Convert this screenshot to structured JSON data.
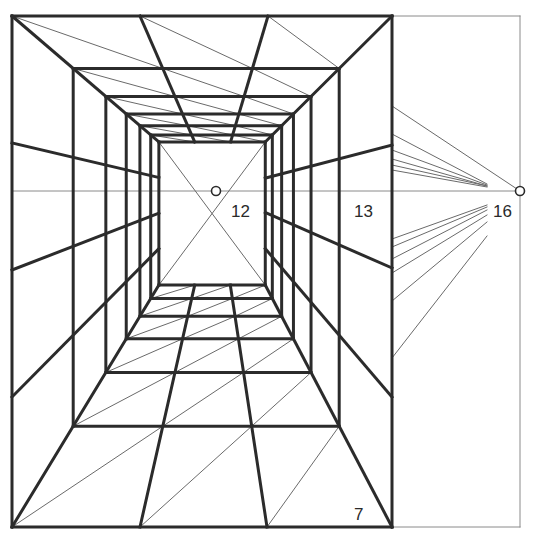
{
  "colors": {
    "background": "#ffffff",
    "heavy_line": "#2b2b2b",
    "thin_line": "#6a6a6a",
    "guide_line": "#8a8a8a"
  },
  "vanishing_point": {
    "x": 216,
    "y": 191,
    "label": "12"
  },
  "horizon_line": {
    "y": 191,
    "x1": 12,
    "x2": 520
  },
  "distance_point": {
    "x": 520,
    "y": 191,
    "label": "16"
  },
  "outer_frame": {
    "left": 12,
    "top": 16,
    "right": 392,
    "bottom": 527
  },
  "reference_frame": {
    "right": 520,
    "top": 16,
    "bottom": 527
  },
  "depth_scales": [
    1,
    0.7,
    0.54,
    0.44,
    0.373,
    0.32,
    0.28
  ],
  "ceiling_dividers_x": [
    140,
    268
  ],
  "floor_dividers_x": [
    140,
    267
  ],
  "wall_lines": {
    "left": [
      143,
      270,
      397
    ],
    "right": [
      145,
      268,
      397
    ]
  },
  "fan_lines": {
    "end_x": 487,
    "upper": [
      {
        "y": 134,
        "end_y": 184
      },
      {
        "y": 150,
        "end_y": 185
      },
      {
        "y": 159,
        "end_y": 186
      },
      {
        "y": 165,
        "end_y": 186
      },
      {
        "y": 170,
        "end_y": 187
      }
    ],
    "upper_full": {
      "y": 106
    },
    "lower": [
      {
        "y": 239,
        "end_y": 205
      },
      {
        "y": 247,
        "end_y": 207
      },
      {
        "y": 259,
        "end_y": 210
      },
      {
        "y": 273,
        "end_y": 215
      },
      {
        "y": 301,
        "end_y": 222
      },
      {
        "y": 358,
        "end_y": 236
      }
    ]
  },
  "labels": [
    {
      "id": "vp",
      "text": "12",
      "x": 231,
      "y": 217
    },
    {
      "id": "wall",
      "text": "13",
      "x": 354,
      "y": 217
    },
    {
      "id": "dp",
      "text": "16",
      "x": 493,
      "y": 217
    },
    {
      "id": "floor",
      "text": "7",
      "x": 354,
      "y": 520
    }
  ]
}
